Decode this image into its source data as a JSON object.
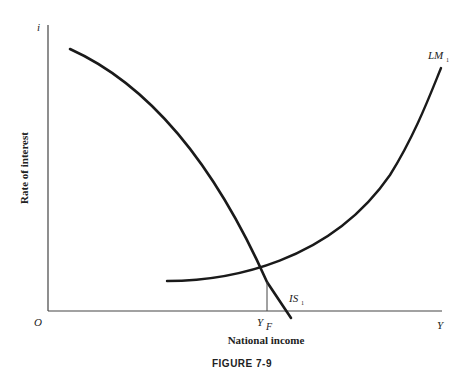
{
  "figure": {
    "caption": "FIGURE 7-9",
    "origin_label": "O",
    "y_axis": {
      "symbol": "i",
      "title": "Rate of interest"
    },
    "x_axis": {
      "symbol": "Y",
      "title": "National income"
    },
    "marker": {
      "label_main": "Y",
      "label_sub": "F"
    },
    "curves": [
      {
        "id": "IS",
        "label_main": "IS",
        "label_sub": "1",
        "color": "#1a1a1a"
      },
      {
        "id": "LM",
        "label_main": "LM",
        "label_sub": "1",
        "color": "#1a1a1a"
      }
    ],
    "colors": {
      "axis": "#444444",
      "curve": "#1a1a1a",
      "text": "#222222"
    }
  }
}
